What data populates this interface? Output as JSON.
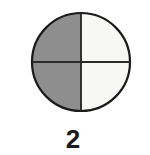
{
  "figure": {
    "caption": "2",
    "background_color": "#ffffff",
    "outline_color": "#1a1a1a",
    "outline_width_px": 2,
    "divider_color": "#2b2b2b",
    "divider_width_px": 2,
    "circle": {
      "center_x": 81,
      "center_y": 62,
      "radius": 49
    },
    "quadrants": [
      {
        "name": "top-left",
        "fill": "#8e8e8e",
        "shaded": true
      },
      {
        "name": "top-right",
        "fill": "#f7f7f5",
        "shaded": false
      },
      {
        "name": "bottom-left",
        "fill": "#8e8e8e",
        "shaded": true
      },
      {
        "name": "bottom-right",
        "fill": "#f7f7f5",
        "shaded": false
      }
    ],
    "icons": {
      "circle": "circle-icon",
      "vertical_divider": "vertical-divider-icon",
      "horizontal_divider": "horizontal-divider-icon"
    }
  }
}
